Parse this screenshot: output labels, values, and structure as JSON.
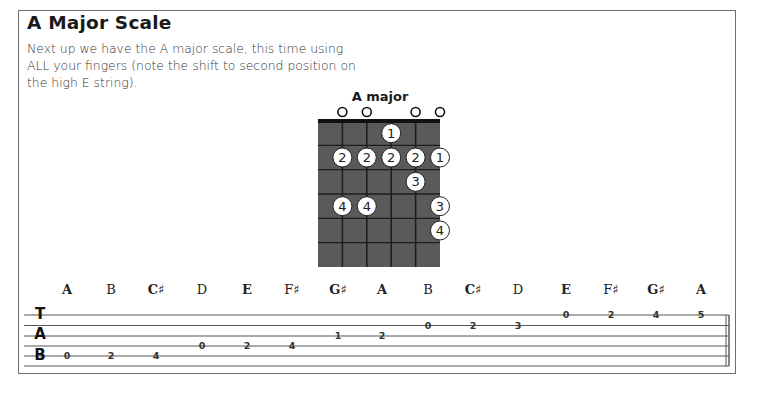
{
  "section": {
    "title": "A Major Scale",
    "intro": "Next up we have the A major scale, this time using ALL your fingers (note the shift to second position on the high E string)."
  },
  "chord_diagram": {
    "name": "A major",
    "strings": [
      "E",
      "A",
      "D",
      "G",
      "B",
      "e"
    ],
    "open_strings": [
      1,
      2,
      4,
      5
    ],
    "frets_shown": 6,
    "dots": [
      {
        "string": 3,
        "fret": 1,
        "finger": "1"
      },
      {
        "string": 1,
        "fret": 2,
        "finger": "2"
      },
      {
        "string": 2,
        "fret": 2,
        "finger": "2"
      },
      {
        "string": 3,
        "fret": 2,
        "finger": "2"
      },
      {
        "string": 4,
        "fret": 2,
        "finger": "2"
      },
      {
        "string": 5,
        "fret": 2,
        "finger": "1"
      },
      {
        "string": 4,
        "fret": 3,
        "finger": "3"
      },
      {
        "string": 1,
        "fret": 4,
        "finger": "4"
      },
      {
        "string": 2,
        "fret": 4,
        "finger": "4"
      },
      {
        "string": 5,
        "fret": 4,
        "finger": "3"
      },
      {
        "string": 5,
        "fret": 5,
        "finger": "4"
      }
    ],
    "colors": {
      "board": "#5a5a5a",
      "lines": "#1e1e1e",
      "dot_fill": "#ffffff"
    }
  },
  "notes": [
    {
      "name": "A",
      "bold": true
    },
    {
      "name": "B",
      "bold": false
    },
    {
      "name": "C♯",
      "bold": true
    },
    {
      "name": "D",
      "bold": false
    },
    {
      "name": "E",
      "bold": true
    },
    {
      "name": "F♯",
      "bold": false
    },
    {
      "name": "G♯",
      "bold": true
    },
    {
      "name": "A",
      "bold": true
    },
    {
      "name": "B",
      "bold": false
    },
    {
      "name": "C♯",
      "bold": true
    },
    {
      "name": "D",
      "bold": false
    },
    {
      "name": "E",
      "bold": true
    },
    {
      "name": "F♯",
      "bold": false
    },
    {
      "name": "G♯",
      "bold": true
    },
    {
      "name": "A",
      "bold": true
    }
  ],
  "tab": {
    "clef": [
      "T",
      "A",
      "B"
    ],
    "entries": [
      {
        "line": 5,
        "fret": "0"
      },
      {
        "line": 5,
        "fret": "2"
      },
      {
        "line": 5,
        "fret": "4"
      },
      {
        "line": 4,
        "fret": "0"
      },
      {
        "line": 4,
        "fret": "2"
      },
      {
        "line": 4,
        "fret": "4"
      },
      {
        "line": 3,
        "fret": "1"
      },
      {
        "line": 3,
        "fret": "2"
      },
      {
        "line": 2,
        "fret": "0"
      },
      {
        "line": 2,
        "fret": "2"
      },
      {
        "line": 2,
        "fret": "3"
      },
      {
        "line": 1,
        "fret": "0"
      },
      {
        "line": 1,
        "fret": "2"
      },
      {
        "line": 1,
        "fret": "4"
      },
      {
        "line": 1,
        "fret": "5"
      }
    ]
  }
}
